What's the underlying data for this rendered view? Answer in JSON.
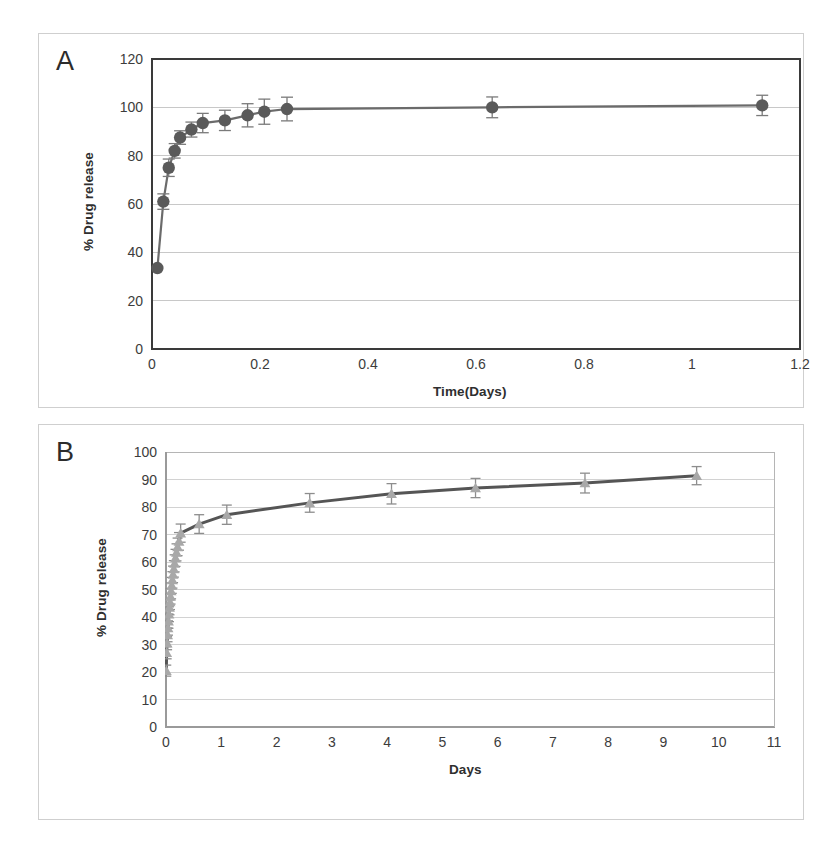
{
  "figure": {
    "background": "#ffffff",
    "panel_border_color": "#cfcfcf"
  },
  "panel_a": {
    "letter": "A",
    "colors": {
      "marker": "#5a5a5a",
      "line": "#6b6b6b",
      "error_bar": "#7a7a7a",
      "gridline": "#c8c8c8",
      "axis": "#3a3a3a",
      "plot_box": "#3a3a3a"
    },
    "y_axis_title": "% Drug release",
    "x_axis_title": "Time(Days)",
    "y_ticks": [
      "0",
      "20",
      "40",
      "60",
      "80",
      "100",
      "120"
    ],
    "x_ticks": [
      "0",
      "0.2",
      "0.4",
      "0.6",
      "0.8",
      "1",
      "1.2"
    ]
  },
  "panel_b": {
    "letter": "B",
    "colors": {
      "marker": "#a8a8a8",
      "line": "#555555",
      "error_bar": "#8d8d8d",
      "gridline": "#d2d2d2",
      "axis": "#9a9a9a",
      "plot_box": "#b5b5b5"
    },
    "y_axis_title": "% Drug release",
    "x_axis_title": "Days",
    "y_ticks": [
      "0",
      "10",
      "20",
      "30",
      "40",
      "50",
      "60",
      "70",
      "80",
      "90",
      "100"
    ],
    "x_ticks": [
      "0",
      "1",
      "2",
      "3",
      "4",
      "5",
      "6",
      "7",
      "8",
      "9",
      "10",
      "11"
    ]
  },
  "chart_data": [
    {
      "panel": "A",
      "type": "line",
      "title": "A",
      "xlabel": "Time(Days)",
      "ylabel": "% Drug release",
      "xlim": [
        0,
        1.2
      ],
      "ylim": [
        0,
        120
      ],
      "xticks": [
        0,
        0.2,
        0.4,
        0.6,
        0.8,
        1,
        1.2
      ],
      "yticks": [
        0,
        20,
        40,
        60,
        80,
        100,
        120
      ],
      "grid": "horizontal",
      "legend": "none",
      "marker": "circle",
      "series": [
        {
          "name": "Drug release A",
          "x": [
            0.01,
            0.021,
            0.031,
            0.042,
            0.052,
            0.073,
            0.094,
            0.135,
            0.177,
            0.208,
            0.25,
            0.63,
            1.13
          ],
          "y": [
            33.5,
            61.0,
            75.0,
            82.0,
            87.5,
            90.8,
            93.5,
            94.6,
            96.7,
            98.2,
            99.3,
            100.0,
            100.8
          ],
          "yerr": [
            0.0,
            3.2,
            3.6,
            3.0,
            2.8,
            3.1,
            4.0,
            4.2,
            4.8,
            5.2,
            4.9,
            4.3,
            4.2
          ]
        }
      ]
    },
    {
      "panel": "B",
      "type": "line",
      "title": "B",
      "xlabel": "Days",
      "ylabel": "% Drug release",
      "xlim": [
        0,
        11
      ],
      "ylim": [
        0,
        100
      ],
      "xticks": [
        0,
        1,
        2,
        3,
        4,
        5,
        6,
        7,
        8,
        9,
        10,
        11
      ],
      "yticks": [
        0,
        10,
        20,
        30,
        40,
        50,
        60,
        70,
        80,
        90,
        100
      ],
      "grid": "horizontal",
      "legend": "none",
      "marker": "triangle",
      "series": [
        {
          "name": "Drug release B",
          "x": [
            0.005,
            0.012,
            0.02,
            0.028,
            0.036,
            0.045,
            0.054,
            0.063,
            0.072,
            0.082,
            0.092,
            0.104,
            0.116,
            0.128,
            0.142,
            0.156,
            0.172,
            0.19,
            0.21,
            0.235,
            0.265,
            0.6,
            1.1,
            2.6,
            4.08,
            5.6,
            7.58,
            9.6
          ],
          "y": [
            20.5,
            27.0,
            30.5,
            33.5,
            36.0,
            38.5,
            41.0,
            43.5,
            45.5,
            47.5,
            49.5,
            51.5,
            53.5,
            55.5,
            57.5,
            59.5,
            61.5,
            63.5,
            65.5,
            67.5,
            70.5,
            73.8,
            77.2,
            81.5,
            84.8,
            86.9,
            88.7,
            91.4
          ],
          "yerr": [
            2.0,
            2.2,
            2.4,
            2.5,
            2.6,
            2.6,
            2.7,
            2.7,
            2.8,
            2.8,
            2.9,
            2.9,
            3.0,
            3.0,
            3.0,
            3.1,
            3.1,
            3.1,
            3.2,
            3.2,
            3.3,
            3.4,
            3.5,
            3.4,
            3.7,
            3.5,
            3.6,
            3.3
          ]
        }
      ]
    }
  ]
}
